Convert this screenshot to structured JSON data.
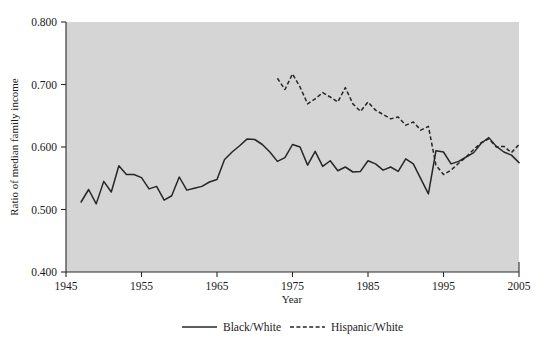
{
  "chart_data": {
    "type": "line",
    "title": "",
    "xlabel": "Year",
    "ylabel": "Ratio of median family income",
    "xlim": [
      1945,
      2005
    ],
    "ylim": [
      0.4,
      0.8
    ],
    "grid": false,
    "legend_position": "bottom",
    "xticks": [
      "1945",
      "1955",
      "1965",
      "1975",
      "1985",
      "1995",
      "2005"
    ],
    "xtick_values": [
      1945,
      1955,
      1965,
      1975,
      1985,
      1995,
      2005
    ],
    "yticks": [
      "0.400",
      "0.500",
      "0.600",
      "0.700",
      "0.800"
    ],
    "ytick_values": [
      0.4,
      0.5,
      0.6,
      0.7,
      0.8
    ],
    "series": [
      {
        "name": "Black/White",
        "style": "solid",
        "x": [
          1947,
          1948,
          1949,
          1950,
          1951,
          1952,
          1953,
          1954,
          1955,
          1956,
          1957,
          1958,
          1959,
          1960,
          1961,
          1962,
          1963,
          1964,
          1965,
          1966,
          1967,
          1968,
          1969,
          1970,
          1971,
          1972,
          1973,
          1974,
          1975,
          1976,
          1977,
          1978,
          1979,
          1980,
          1981,
          1982,
          1983,
          1984,
          1985,
          1986,
          1987,
          1988,
          1989,
          1990,
          1991,
          1992,
          1993,
          1994,
          1995,
          1996,
          1997,
          1998,
          1999,
          2000,
          2001,
          2002,
          2003,
          2004,
          2005
        ],
        "values": [
          0.512,
          0.532,
          0.509,
          0.545,
          0.528,
          0.57,
          0.556,
          0.556,
          0.551,
          0.533,
          0.537,
          0.515,
          0.522,
          0.552,
          0.531,
          0.534,
          0.537,
          0.544,
          0.548,
          0.58,
          0.592,
          0.602,
          0.613,
          0.612,
          0.604,
          0.592,
          0.577,
          0.583,
          0.604,
          0.6,
          0.571,
          0.593,
          0.569,
          0.578,
          0.562,
          0.568,
          0.56,
          0.561,
          0.578,
          0.573,
          0.563,
          0.568,
          0.561,
          0.581,
          0.573,
          0.549,
          0.525,
          0.594,
          0.592,
          0.573,
          0.577,
          0.584,
          0.591,
          0.606,
          0.615,
          0.601,
          0.592,
          0.587,
          0.575
        ]
      },
      {
        "name": "Hispanic/White",
        "style": "dashed",
        "x": [
          1973,
          1974,
          1975,
          1976,
          1977,
          1978,
          1979,
          1980,
          1981,
          1982,
          1983,
          1984,
          1985,
          1986,
          1987,
          1988,
          1989,
          1990,
          1991,
          1992,
          1993,
          1994,
          1995,
          1996,
          1997,
          1998,
          1999,
          2000,
          2001,
          2002,
          2003,
          2004,
          2005
        ],
        "values": [
          0.71,
          0.692,
          0.717,
          0.696,
          0.669,
          0.677,
          0.687,
          0.68,
          0.672,
          0.695,
          0.669,
          0.657,
          0.672,
          0.659,
          0.652,
          0.645,
          0.648,
          0.635,
          0.64,
          0.627,
          0.633,
          0.571,
          0.556,
          0.563,
          0.574,
          0.584,
          0.596,
          0.607,
          0.613,
          0.6,
          0.601,
          0.591,
          0.604
        ]
      }
    ],
    "legend": [
      {
        "label": "Black/White",
        "style": "solid"
      },
      {
        "label": "Hispanic/White",
        "style": "dashed"
      }
    ],
    "colors": {
      "plot_background": "#d5d5d5",
      "line": "#262626",
      "axis": "#2a2a2a",
      "page_background": "#ffffff"
    }
  }
}
